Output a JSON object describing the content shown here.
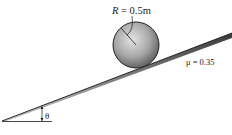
{
  "diagram": {
    "type": "inclined-plane-rolling-sphere",
    "radius_label": "R = 0.5m",
    "radius_symbol": "R",
    "radius_value": "= 0.5m",
    "friction_label": "μ = 0.35",
    "angle_label": "θ",
    "colors": {
      "sphere_light": "#d8d8d8",
      "sphere_dark": "#5a5a5a",
      "incline": "#8a8a8a",
      "line": "#1a1a1a"
    }
  }
}
